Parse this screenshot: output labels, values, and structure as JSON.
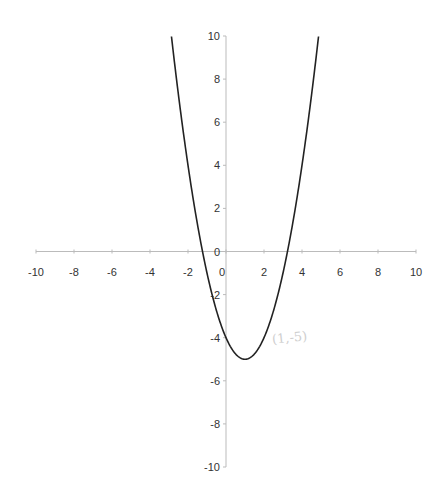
{
  "chart_data": {
    "type": "line",
    "title": "",
    "xlabel": "",
    "ylabel": "",
    "xlim": [
      -10,
      10
    ],
    "ylim": [
      -10,
      10
    ],
    "grid": false,
    "legend": null,
    "x_ticks": [
      "-10",
      "-8",
      "-6",
      "-4",
      "-2",
      "0",
      "2",
      "4",
      "6",
      "8",
      "10"
    ],
    "y_ticks": [
      "10",
      "8",
      "6",
      "4",
      "2",
      "0",
      "-2",
      "-4",
      "-6",
      "-8",
      "-10"
    ],
    "series": [
      {
        "name": "y = x^2 - 2x - 4",
        "x": [
          -2.87,
          -2,
          -1.5,
          -1,
          -0.5,
          0,
          0.5,
          1,
          1.5,
          2,
          2.5,
          3,
          3.5,
          4,
          4.5,
          4.87
        ],
        "y": [
          10,
          4,
          0.25,
          -1,
          -3.75,
          -4,
          -4.75,
          -5,
          -4.75,
          -4,
          -2.75,
          -1,
          0.25,
          4,
          6.25,
          10
        ]
      }
    ],
    "annotations": [
      {
        "text": "(1,-5)",
        "note": "faint handwritten vertex label near vertex"
      }
    ]
  },
  "annotation_text": "(1,-5)"
}
